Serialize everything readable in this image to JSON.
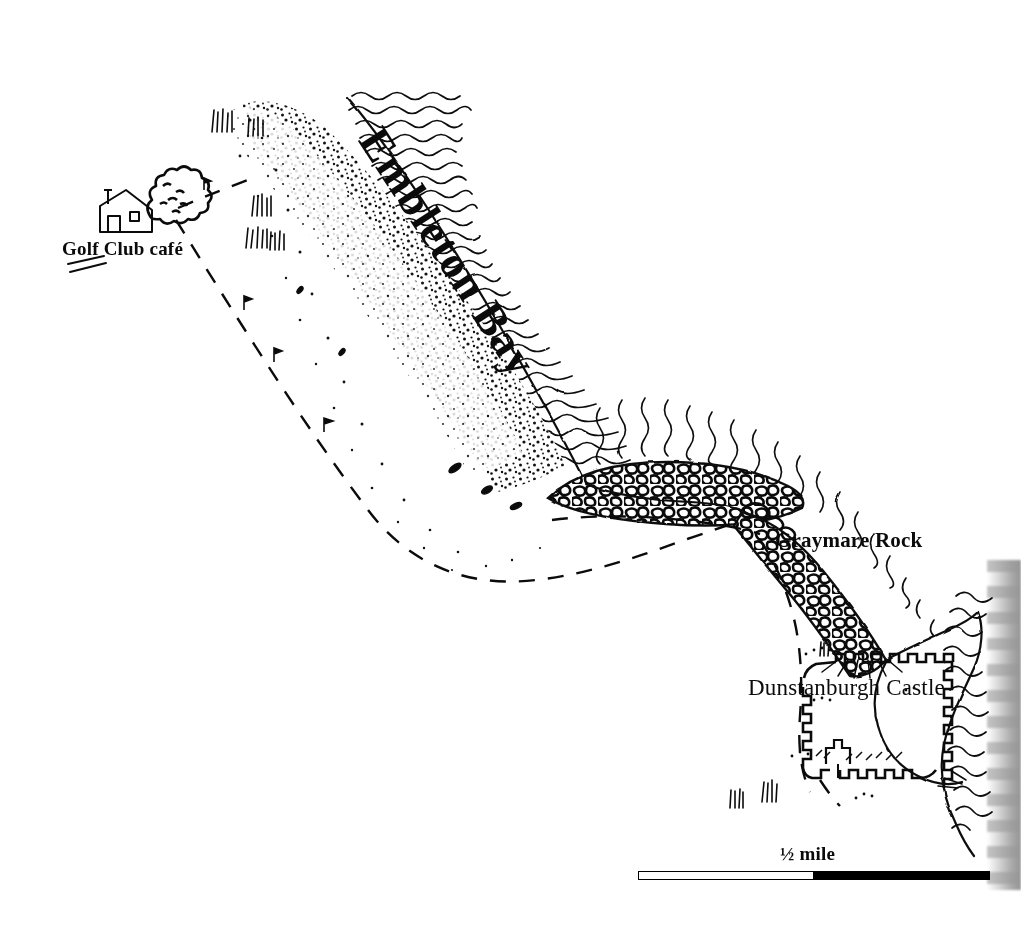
{
  "map": {
    "title": "Embleton Bay and Dunstanburgh Castle",
    "style": "hand-drawn pen-and-ink sketch map",
    "background_color": "#ffffff",
    "ink_color": "#0b0b0b",
    "width": 1021,
    "height": 934,
    "labels": {
      "bay": "Embleton Bay",
      "rock": "Graymare Rock",
      "castle": "Dunstanburgh Castle",
      "golf_club": "Golf Club café"
    },
    "scale": {
      "value": "½ mile",
      "bar_left_segment": "white",
      "bar_right_segment": "black",
      "bar_length_px": 352
    },
    "features": [
      {
        "name": "sea",
        "kind": "water",
        "texture": "wavy-lines"
      },
      {
        "name": "sand-dunes",
        "kind": "dunes",
        "texture": "stipple-dots"
      },
      {
        "name": "beach",
        "kind": "beach",
        "texture": "blank"
      },
      {
        "name": "graymare-rock",
        "kind": "rocks",
        "texture": "pebble-outlines"
      },
      {
        "name": "rocky-shore",
        "kind": "rocks",
        "texture": "pebble-outlines"
      },
      {
        "name": "dunstanburgh-castle",
        "kind": "ruin",
        "texture": "crenellated-wall"
      },
      {
        "name": "footpath",
        "kind": "path",
        "texture": "dashed-line"
      },
      {
        "name": "golf-course",
        "kind": "golf",
        "texture": "flag-markers"
      },
      {
        "name": "grass-tufts",
        "kind": "vegetation",
        "texture": "short-strokes"
      }
    ]
  }
}
